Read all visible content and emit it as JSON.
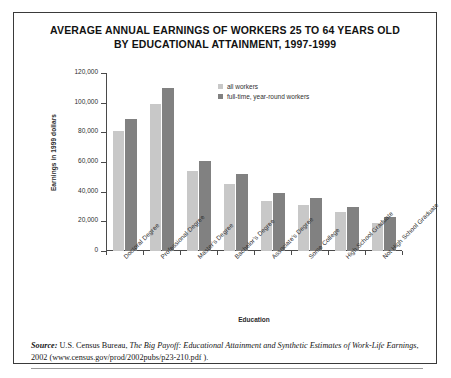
{
  "chart_data": {
    "type": "bar",
    "title": "AVERAGE ANNUAL EARNINGS OF WORKERS 25 TO 64 YEARS OLD BY EDUCATIONAL ATTAINMENT, 1997-1999",
    "title_line1": "AVERAGE ANNUAL EARNINGS OF WORKERS 25 TO 64 YEARS OLD",
    "title_line2": "BY EDUCATIONAL ATTAINMENT, 1997-1999",
    "xlabel": "Education",
    "ylabel": "Earnings in 1999 dollars",
    "ylim": [
      0,
      120000
    ],
    "ytick_labels": [
      "0",
      "20,000",
      "40,000",
      "60,000",
      "80,000",
      "100,000",
      "120,000"
    ],
    "ytick_values": [
      0,
      20000,
      40000,
      60000,
      80000,
      100000,
      120000
    ],
    "grid": false,
    "legend_position": "top-center",
    "categories": [
      "Doctoral Degree",
      "Professional Degree",
      "Master's Degree",
      "Bachelor's Degree",
      "Associate's Degree",
      "Some College",
      "High School Graduate",
      "Not High School Graduate"
    ],
    "series": [
      {
        "name": "all workers",
        "color": "#c8c8c8",
        "values": [
          81000,
          99000,
          54000,
          45000,
          34000,
          31000,
          26000,
          19000
        ]
      },
      {
        "name": "full-time, year-round workers",
        "color": "#818181",
        "values": [
          89000,
          110000,
          61000,
          52000,
          39000,
          36000,
          30000,
          23000
        ]
      }
    ]
  },
  "source": {
    "label": "Source:",
    "text_before_italic": " U.S. Census Bureau, ",
    "italic_title": "The Big Payoff: Educational Attainment and Synthetic Estimates of Work-Life Earnings",
    "text_after_italic": ", 2002 (www.census.gov/prod/2002pubs/p23-210.pdf )."
  }
}
